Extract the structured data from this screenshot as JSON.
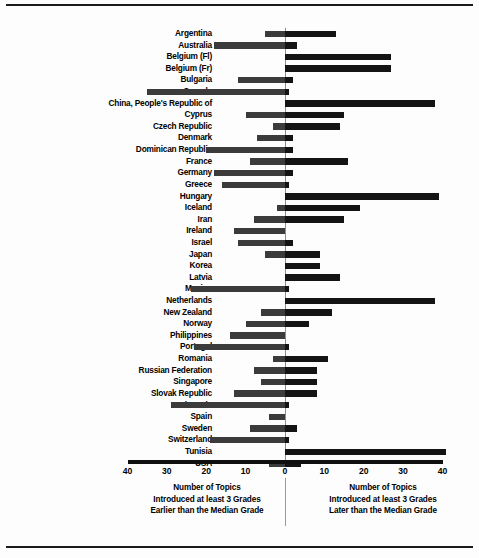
{
  "chart_data": {
    "type": "bar",
    "orientation": "horizontal-diverging",
    "title": "",
    "xlabel": "Number of Topics",
    "ylabel": "",
    "xlim": [
      -40,
      40
    ],
    "grid": false,
    "legend_position": "none",
    "axis_ticks": [
      {
        "label": "40",
        "value": -40
      },
      {
        "label": "30",
        "value": -30
      },
      {
        "label": "20",
        "value": -20
      },
      {
        "label": "10",
        "value": -10
      },
      {
        "label": "0",
        "value": 0
      },
      {
        "label": "10",
        "value": 10
      },
      {
        "label": "20",
        "value": 20
      },
      {
        "label": "30",
        "value": 30
      },
      {
        "label": "40",
        "value": 40
      }
    ],
    "left_caption": {
      "line1": "Number of Topics",
      "line2": "Introduced at least 3 Grades",
      "line3": "Earlier than the Median Grade"
    },
    "right_caption": {
      "line1": "Number of Topics",
      "line2": "Introduced at least 3 Grades",
      "line3": "Later than the Median Grade"
    },
    "categories": [
      "Argentina",
      "Australia",
      "Belgium (Fl)",
      "Belgium (Fr)",
      "Bulgaria",
      "Canada",
      "China, People's Republic of",
      "Cyprus",
      "Czech Republic",
      "Denmark",
      "Dominican Republic",
      "France",
      "Germany",
      "Greece",
      "Hungary",
      "Iceland",
      "Iran",
      "Ireland",
      "Israel",
      "Japan",
      "Korea",
      "Latvia",
      "Mexico",
      "Netherlands",
      "New Zealand",
      "Norway",
      "Philippines",
      "Portugal",
      "Romania",
      "Russian Federation",
      "Singapore",
      "Slovak Republic",
      "Slovenia",
      "Spain",
      "Sweden",
      "Switzerland",
      "Tunisia",
      "USA"
    ],
    "series": [
      {
        "name": "Introduced at least 3 Grades Earlier than the Median Grade",
        "side": "left",
        "color": "#3b3b3b",
        "values": [
          5,
          18,
          0,
          0,
          12,
          35,
          0,
          10,
          3,
          7,
          20,
          9,
          18,
          16,
          0,
          2,
          8,
          13,
          12,
          5,
          0,
          0,
          24,
          0,
          6,
          10,
          14,
          23,
          3,
          8,
          6,
          13,
          29,
          4,
          9,
          19,
          0,
          4
        ]
      },
      {
        "name": "Introduced at least 3 Grades Later than the Median Grade",
        "side": "right",
        "color": "#141414",
        "values": [
          13,
          3,
          27,
          27,
          2,
          1,
          38,
          15,
          14,
          2,
          2,
          16,
          2,
          1,
          39,
          19,
          15,
          0,
          2,
          9,
          9,
          14,
          1,
          38,
          12,
          6,
          0,
          1,
          11,
          8,
          8,
          8,
          1,
          0,
          3,
          1,
          41,
          4
        ]
      }
    ]
  }
}
